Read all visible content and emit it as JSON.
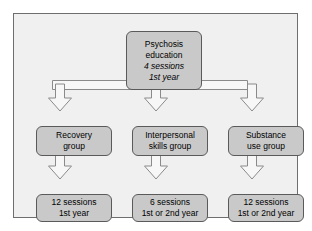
{
  "figure": {
    "colors": {
      "page_background": "#ffffff",
      "panel_background": "#f0f0f0",
      "panel_border": "#6e6e6e",
      "node_fill": "#c9c9c9",
      "node_border": "#5a5a5a",
      "arrow_fill": "#f7f7f7",
      "arrow_border": "#8a8a8a",
      "text": "#000000"
    }
  },
  "nodes": {
    "root": {
      "name": "psychosis-education",
      "lines": [
        "Psychosis",
        "education",
        "4 sessions",
        "1st year"
      ],
      "italic_lines": [
        false,
        false,
        true,
        true
      ]
    },
    "groups": [
      {
        "name": "recovery-group",
        "lines": [
          "Recovery",
          "group"
        ],
        "italic_lines": [
          false,
          false
        ]
      },
      {
        "name": "interpersonal-skills-group",
        "lines": [
          "Interpersonal",
          "skills group"
        ],
        "italic_lines": [
          false,
          false
        ]
      },
      {
        "name": "substance-use-group",
        "lines": [
          "Substance",
          "use group"
        ],
        "italic_lines": [
          false,
          false
        ]
      }
    ],
    "outcomes": [
      {
        "name": "recovery-group-sessions",
        "lines": [
          "12 sessions",
          "1st year"
        ],
        "italic_lines": [
          false,
          false
        ]
      },
      {
        "name": "interpersonal-skills-group-sessions",
        "lines": [
          "6 sessions",
          "1st or 2nd year"
        ],
        "italic_lines": [
          false,
          false
        ]
      },
      {
        "name": "substance-use-group-sessions",
        "lines": [
          "12 sessions",
          "1st or 2nd year"
        ],
        "italic_lines": [
          false,
          false
        ]
      }
    ]
  },
  "connectors": [
    {
      "name": "root-to-recovery-group",
      "type": "block-arrow-down"
    },
    {
      "name": "root-to-interpersonal-skills-group",
      "type": "block-arrow-down"
    },
    {
      "name": "root-to-substance-use-group",
      "type": "block-arrow-down"
    },
    {
      "name": "recovery-group-to-sessions",
      "type": "block-arrow-down"
    },
    {
      "name": "interpersonal-skills-group-to-sessions",
      "type": "block-arrow-down"
    },
    {
      "name": "substance-use-group-to-sessions",
      "type": "block-arrow-down"
    }
  ]
}
